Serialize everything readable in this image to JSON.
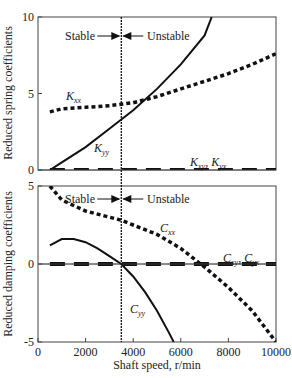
{
  "chart_data": [
    {
      "type": "line",
      "title": "",
      "xlabel": "",
      "ylabel": "Reduced spring coefficients",
      "xlim": [
        0,
        10000
      ],
      "ylim": [
        0,
        10
      ],
      "yticks": [
        "0",
        "5",
        "10"
      ],
      "stability_divider_x": 3500,
      "annotations": {
        "stable": "Stable",
        "unstable": "Unstable"
      },
      "series": [
        {
          "name": "Kxx",
          "label": "K",
          "sub": "xx",
          "style": "dotted",
          "x": [
            500,
            1000,
            2000,
            3000,
            3500,
            4000,
            5000,
            6000,
            7000,
            8000,
            9000,
            10000
          ],
          "y": [
            3.8,
            4.0,
            4.1,
            4.2,
            4.3,
            4.4,
            4.8,
            5.3,
            5.8,
            6.3,
            6.9,
            7.6
          ]
        },
        {
          "name": "Kyy",
          "label": "K",
          "sub": "yy",
          "style": "solid",
          "x": [
            500,
            1000,
            2000,
            3000,
            3500,
            4000,
            5000,
            6000,
            7000,
            7300
          ],
          "y": [
            0.0,
            0.5,
            1.5,
            2.7,
            3.3,
            3.9,
            5.3,
            6.9,
            8.8,
            10.0
          ]
        },
        {
          "name": "Kxy, Kyx",
          "label": "K",
          "sub": "xy",
          "label2": "K",
          "sub2": "yx",
          "style": "dashed",
          "x": [
            500,
            10000
          ],
          "y": [
            0.0,
            0.0
          ]
        }
      ]
    },
    {
      "type": "line",
      "title": "",
      "xlabel": "Shaft speed, r/min",
      "ylabel": "Reduced damping coefficients",
      "xlim": [
        0,
        10000
      ],
      "ylim": [
        -5,
        5
      ],
      "xticks": [
        "0",
        "2000",
        "4000",
        "6000",
        "8000",
        "10000"
      ],
      "yticks": [
        "-5",
        "0",
        "5"
      ],
      "stability_divider_x": 3500,
      "annotations": {
        "stable": "Stable",
        "unstable": "Unstable"
      },
      "series": [
        {
          "name": "Cxx",
          "label": "C",
          "sub": "xx",
          "style": "dotted",
          "x": [
            500,
            1000,
            2000,
            3000,
            3500,
            4000,
            5000,
            6000,
            7000,
            8000,
            9000,
            10000
          ],
          "y": [
            5.0,
            4.1,
            3.4,
            3.0,
            2.8,
            2.5,
            1.9,
            1.0,
            -0.2,
            -1.5,
            -3.0,
            -5.0
          ]
        },
        {
          "name": "Cyy",
          "label": "C",
          "sub": "yy",
          "style": "solid",
          "x": [
            500,
            1000,
            1500,
            2000,
            2500,
            3000,
            3500,
            4000,
            4500,
            5000,
            5500,
            5700
          ],
          "y": [
            1.2,
            1.6,
            1.6,
            1.4,
            1.0,
            0.5,
            0.0,
            -0.8,
            -1.8,
            -3.0,
            -4.4,
            -5.0
          ]
        },
        {
          "name": "Cxy, Cyx",
          "label": "C",
          "sub": "xy",
          "label2": "C",
          "sub2": "yx",
          "style": "dashed",
          "x": [
            500,
            10000
          ],
          "y": [
            0.0,
            0.0
          ]
        }
      ]
    }
  ],
  "labels": {
    "top_ylabel": "Reduced spring coefficients",
    "bottom_ylabel": "Reduced damping coefficients",
    "xlabel": "Shaft speed, r/min",
    "stable": "Stable",
    "unstable": "Unstable"
  }
}
